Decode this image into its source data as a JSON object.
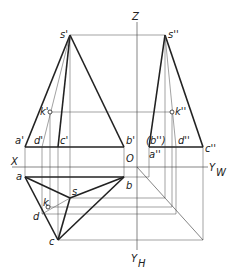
{
  "diagram": {
    "axes": {
      "z": "Z",
      "x": "X",
      "origin": "O",
      "yw": "Y",
      "yw_sub": "W",
      "yh": "Y",
      "yh_sub": "H"
    },
    "front_view": {
      "s": "s'",
      "a": "a'",
      "b": "b'",
      "c": "c'",
      "d": "d'",
      "k": "k'"
    },
    "side_view": {
      "s": "s''",
      "a": "a''",
      "b": "(b'')",
      "c": "c''",
      "d": "d''",
      "k": "k''"
    },
    "top_view": {
      "s": "s",
      "a": "a",
      "b": "b",
      "c": "c",
      "d": "d",
      "k": "k"
    }
  }
}
